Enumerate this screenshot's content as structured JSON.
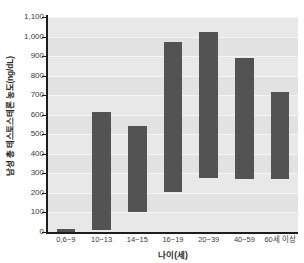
{
  "chart_data": {
    "type": "bar",
    "subtype": "floating-range-bar",
    "title": "",
    "xlabel": "나이(세)",
    "ylabel": "남성 총 테스토스테론 농도(ng/dL)",
    "categories": [
      "0,6~9",
      "10~13",
      "14~15",
      "16~19",
      "20~39",
      "40~59",
      "60세 이상"
    ],
    "series": [
      {
        "name": "남성 총 테스토스테론 농도 범위",
        "low": [
          0,
          10,
          100,
          205,
          275,
          270,
          270
        ],
        "high": [
          13,
          615,
          540,
          970,
          1025,
          890,
          715
        ]
      }
    ],
    "ylim": [
      0,
      1100
    ],
    "yticks": [
      "0",
      "100",
      "200",
      "300",
      "400",
      "500",
      "600",
      "700",
      "800",
      "900",
      "1,000",
      "1,100"
    ],
    "ytick_values": [
      0,
      100,
      200,
      300,
      400,
      500,
      600,
      700,
      800,
      900,
      1000,
      1100
    ],
    "grid": true,
    "legend": "none",
    "bar_color": "#535353",
    "plot_background": "#e8e8e8",
    "axis_color": "#1d1d1d"
  }
}
